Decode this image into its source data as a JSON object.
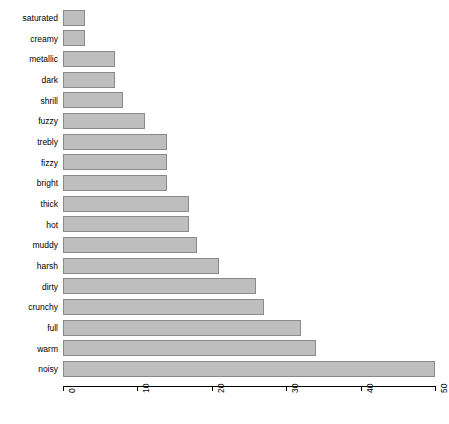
{
  "chart_data": {
    "type": "bar",
    "orientation": "horizontal",
    "title": "",
    "xlabel": "",
    "ylabel": "",
    "xlim": [
      0,
      50
    ],
    "grid": false,
    "legend": false,
    "bar_color": "#bebebe",
    "bar_border_color": "#8a8a8a",
    "axis_color": "#000000",
    "xticks": [
      0,
      10,
      20,
      30,
      40,
      50
    ],
    "xtick_labels": [
      "0",
      "10",
      "20",
      "30",
      "40",
      "50"
    ],
    "categories": [
      "saturated",
      "creamy",
      "metallic",
      "dark",
      "shrill",
      "fuzzy",
      "trebly",
      "fizzy",
      "bright",
      "thick",
      "hot",
      "muddy",
      "harsh",
      "dirty",
      "crunchy",
      "full",
      "warm",
      "noisy"
    ],
    "values": [
      3,
      3,
      7,
      7,
      8,
      11,
      14,
      14,
      14,
      17,
      17,
      18,
      21,
      26,
      27,
      32,
      34,
      50
    ]
  }
}
